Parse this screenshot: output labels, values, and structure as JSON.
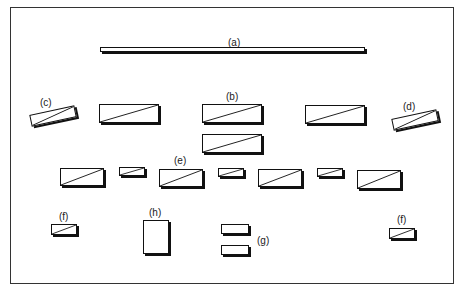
{
  "diagram": {
    "type": "figure-layout",
    "labels": {
      "a": "(a)",
      "b": "(b)",
      "c": "(c)",
      "d": "(d)",
      "e": "(e)",
      "f_left": "(f)",
      "f_right": "(f)",
      "g": "(g)",
      "h": "(h)"
    },
    "colors": {
      "stroke": "#111111",
      "background": "#ffffff",
      "frame": "#333333"
    }
  }
}
